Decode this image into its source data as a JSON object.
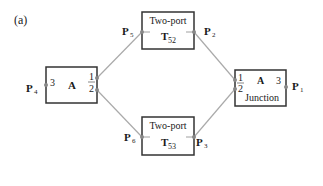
{
  "figure": {
    "panel_label": "(a)",
    "colors": {
      "box_stroke": "#333333",
      "wire": "#aaaaaa",
      "port": "#888888",
      "text": "#1a1a1a"
    }
  },
  "blocks": {
    "left": {
      "title": "A",
      "ports": {
        "p3": "3",
        "p1": "1",
        "p2": "2"
      }
    },
    "top_two_port": {
      "title": "Two-port",
      "name_main": "T",
      "name_sub": "52"
    },
    "bottom_two_port": {
      "title": "Two-port",
      "name_main": "T",
      "name_sub": "53"
    },
    "junction": {
      "title": "A",
      "subtitle": "Junction",
      "ports": {
        "p1": "1",
        "p2": "2",
        "p3": "3"
      }
    }
  },
  "points": {
    "p4": {
      "main": "P",
      "sub": "4"
    },
    "p5": {
      "main": "P",
      "sub": "5"
    },
    "p6": {
      "main": "P",
      "sub": "6"
    },
    "p2": {
      "main": "P",
      "sub": "2"
    },
    "p3": {
      "main": "P",
      "sub": "3"
    },
    "p1": {
      "main": "P",
      "sub": "1"
    }
  }
}
